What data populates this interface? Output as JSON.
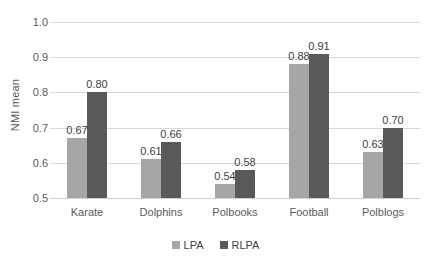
{
  "chart_data": {
    "type": "bar",
    "title": "",
    "xlabel": "",
    "ylabel": "NMI mean",
    "ylim": [
      0.5,
      1.0
    ],
    "ytick_step": 0.1,
    "yticks": [
      "1.0",
      "0.9",
      "0.8",
      "0.7",
      "0.6",
      "0.5"
    ],
    "ytick_values": [
      1.0,
      0.9,
      0.8,
      0.7,
      0.6,
      0.5
    ],
    "grid": true,
    "grid_axis": "y",
    "legend_position": "bottom",
    "categories": [
      "Karate",
      "Dolphins",
      "Polbooks",
      "Football",
      "Polblogs"
    ],
    "series": [
      {
        "name": "LPA",
        "color": "#a6a6a6",
        "values": [
          0.67,
          0.61,
          0.54,
          0.88,
          0.63
        ],
        "labels": [
          "0.67",
          "0.61",
          "0.54",
          "0.88",
          "0.63"
        ]
      },
      {
        "name": "RLPA",
        "color": "#595959",
        "values": [
          0.8,
          0.66,
          0.58,
          0.91,
          0.7
        ],
        "labels": [
          "0.80",
          "0.66",
          "0.58",
          "0.91",
          "0.70"
        ]
      }
    ]
  },
  "legend": {
    "items": [
      {
        "label": "LPA",
        "color": "#a6a6a6"
      },
      {
        "label": "RLPA",
        "color": "#595959"
      }
    ]
  },
  "colors": {
    "lpa": "#a6a6a6",
    "rlpa": "#595959",
    "gridline": "#d9d9d9",
    "text": "#404040",
    "axis_text": "#5a5a5a",
    "background": "#ffffff"
  }
}
